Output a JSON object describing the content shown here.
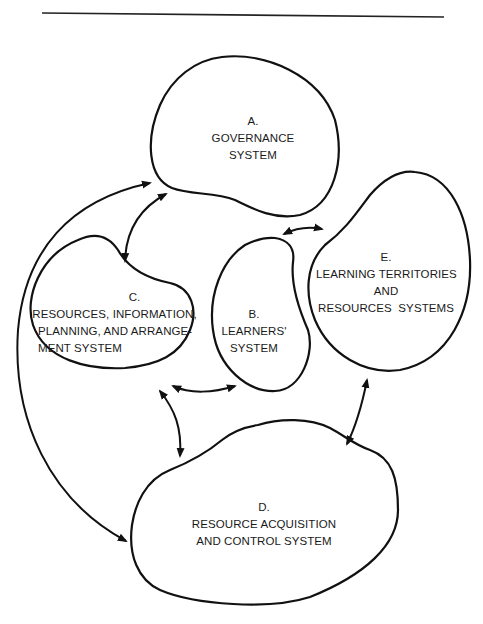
{
  "diagram": {
    "nodes": [
      {
        "id": "A",
        "letter": "A.",
        "lines": [
          "GOVERNANCE",
          "SYSTEM"
        ]
      },
      {
        "id": "B",
        "letter": "B.",
        "lines": [
          "LEARNERS'",
          "SYSTEM"
        ]
      },
      {
        "id": "C",
        "letter": "C.",
        "lines": [
          "RESOURCES, INFORMATION,",
          "PLANNING, AND ARRANGE-",
          "MENT SYSTEM"
        ]
      },
      {
        "id": "D",
        "letter": "D.",
        "lines": [
          "RESOURCE ACQUISITION",
          "AND CONTROL SYSTEM"
        ]
      },
      {
        "id": "E",
        "letter": "E.",
        "lines": [
          "LEARNING TERRITORIES",
          "AND",
          "RESOURCES  SYSTEMS"
        ]
      }
    ],
    "edges": [
      {
        "from": "A",
        "to": "D",
        "type": "bidirectional",
        "route": "outer-left-loop"
      },
      {
        "from": "A",
        "to": "C",
        "type": "bidirectional"
      },
      {
        "from": "A",
        "to": "E",
        "type": "bidirectional"
      },
      {
        "from": "C",
        "to": "B",
        "type": "bidirectional"
      },
      {
        "from": "C",
        "to": "D",
        "type": "bidirectional"
      },
      {
        "from": "E",
        "to": "D",
        "type": "bidirectional"
      }
    ],
    "colors": {
      "stroke": "#111111",
      "text": "#1a1a1a",
      "background": "#ffffff"
    }
  }
}
